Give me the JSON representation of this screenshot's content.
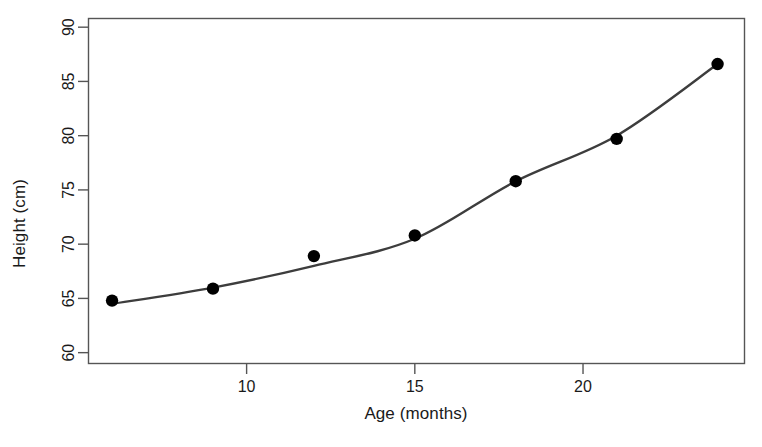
{
  "chart_data": {
    "type": "scatter",
    "title": "",
    "xlabel": "Age (months)",
    "ylabel": "Height (cm)",
    "x": [
      6,
      9,
      12,
      15,
      18,
      21,
      24
    ],
    "values": [
      64.8,
      65.9,
      68.9,
      70.8,
      75.8,
      79.7,
      86.6
    ],
    "series": [
      {
        "name": "Observed height",
        "x": [
          6,
          9,
          12,
          15,
          18,
          21,
          24
        ],
        "values": [
          64.8,
          65.9,
          68.9,
          70.8,
          75.8,
          79.7,
          86.6
        ],
        "marker": "filled-circle",
        "color": "#000000"
      },
      {
        "name": "Fitted curve",
        "x": [
          6,
          9,
          12,
          15,
          18,
          21,
          24
        ],
        "values": [
          64.5,
          66.0,
          68.0,
          70.5,
          75.8,
          80.0,
          86.6
        ],
        "marker": "none",
        "color": "#3d3d3d"
      }
    ],
    "xlim": [
      5.3,
      24.8
    ],
    "ylim": [
      59.0,
      90.8
    ],
    "xticks": [
      10,
      15,
      20
    ],
    "xticklabels": [
      "10",
      "15",
      "20"
    ],
    "yticks": [
      60,
      65,
      70,
      75,
      80,
      85,
      90
    ],
    "yticklabels": [
      "60",
      "65",
      "70",
      "75",
      "80",
      "85",
      "90"
    ],
    "grid": false,
    "legend": "none",
    "frame": true,
    "annotations": []
  },
  "axes": {
    "x_title": "Age (months)",
    "y_title": "Height (cm)"
  },
  "ticks": {
    "x": [
      "10",
      "15",
      "20"
    ],
    "y": [
      "60",
      "65",
      "70",
      "75",
      "80",
      "85",
      "90"
    ]
  },
  "colors": {
    "line": "#3d3d3d",
    "marker": "#000000",
    "frame": "#555555",
    "background": "#ffffff",
    "text": "#1a1a1a"
  }
}
